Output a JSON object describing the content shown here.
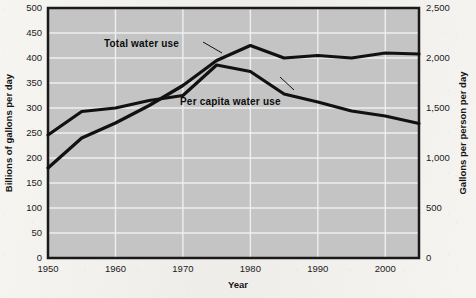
{
  "chart_data": {
    "type": "line",
    "title": "",
    "xlabel": "Year",
    "ylabel_left": "Billions of gallons per day",
    "ylabel_right": "Gallons per person per day",
    "grid": true,
    "legend_position": "inline-annotations",
    "xlim": [
      1950,
      2005
    ],
    "xticks": [
      1950,
      1960,
      1970,
      1980,
      1990,
      2000
    ],
    "xticklabels": [
      "1950",
      "1960",
      "1970",
      "1980",
      "1990",
      "2000"
    ],
    "ylim_left": [
      0,
      500
    ],
    "yticks_left": [
      0,
      50,
      100,
      150,
      200,
      250,
      300,
      350,
      400,
      450,
      500
    ],
    "yticklabels_left": [
      "0",
      "50",
      "100",
      "150",
      "200",
      "250",
      "300",
      "350",
      "400",
      "450",
      "500"
    ],
    "ylim_right": [
      0,
      2500
    ],
    "yticks_right": [
      0,
      500,
      1000,
      1500,
      2000,
      2500
    ],
    "yticklabels_right": [
      "0",
      "500",
      "1,000",
      "1,500",
      "2,000",
      "2,500"
    ],
    "x": [
      1950,
      1955,
      1960,
      1965,
      1970,
      1975,
      1980,
      1985,
      1990,
      1995,
      2000,
      2005
    ],
    "series": [
      {
        "name": "Total water use",
        "axis": "left",
        "unit": "Billions of gallons per day",
        "values": [
          180,
          240,
          270,
          305,
          345,
          395,
          425,
          400,
          405,
          400,
          410,
          408
        ],
        "color": "#111111"
      },
      {
        "name": "Per capita water use",
        "axis": "right",
        "unit": "Gallons per person per day",
        "values": [
          1230,
          1465,
          1500,
          1575,
          1625,
          1930,
          1865,
          1640,
          1560,
          1470,
          1420,
          1345
        ],
        "color": "#111111"
      }
    ],
    "annotations": [
      {
        "text": "Total water use",
        "x": 1957,
        "y": 437,
        "axis": "left"
      },
      {
        "text": "Per capita water use",
        "x": 1968,
        "y": 312,
        "axis": "left"
      }
    ]
  },
  "axis": {
    "x_title": "Year",
    "y_left_title": "Billions of gallons per day",
    "y_right_title": "Gallons per person per day"
  },
  "labels": {
    "total_water_use": "Total water use",
    "per_capita_water_use": "Per capita water use"
  },
  "colors": {
    "plot_background": "#c4c4c4",
    "grid": "#efefef",
    "line": "#111111",
    "frame": "#1a1a1a",
    "page": "#f3f2ee"
  }
}
